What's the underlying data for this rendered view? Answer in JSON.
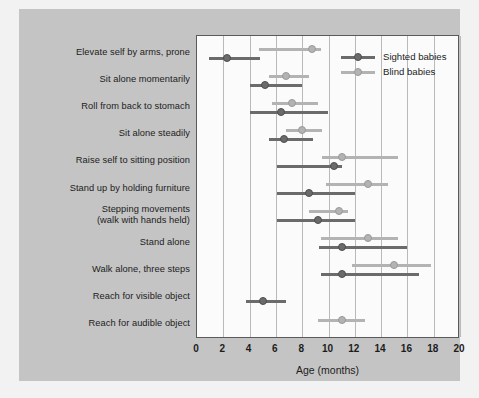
{
  "chart_data": {
    "type": "scatter",
    "title": "",
    "xlabel": "Age (months)",
    "ylabel": "",
    "xlim": [
      0,
      20
    ],
    "xticks": [
      "0",
      "2",
      "4",
      "6",
      "8",
      "10",
      "12",
      "14",
      "16",
      "18",
      "20"
    ],
    "grid": "vertical",
    "legend_position": "top-right",
    "legend": [
      {
        "name": "Sighted babies",
        "color": "#6b6b6b"
      },
      {
        "name": "Blind babies",
        "color": "#b3b3b3"
      }
    ],
    "categories": [
      "Elevate self by arms, prone",
      "Sit alone momentarily",
      "Roll from back to stomach",
      "Sit alone steadily",
      "Raise self to sitting position",
      "Stand up by holding furniture",
      "Stepping movements\n(walk with hands held)",
      "Stand alone",
      "Walk alone, three steps",
      "Reach for visible object",
      "Reach for audible object"
    ],
    "series": [
      {
        "name": "Sighted babies",
        "color": "#6b6b6b",
        "points": [
          {
            "category": "Elevate self by arms, prone",
            "median": 2.3,
            "low": 0.9,
            "high": 4.8
          },
          {
            "category": "Sit alone momentarily",
            "median": 5.2,
            "low": 4.0,
            "high": 8.0
          },
          {
            "category": "Roll from back to stomach",
            "median": 6.4,
            "low": 4.0,
            "high": 10.0
          },
          {
            "category": "Sit alone steadily",
            "median": 6.6,
            "low": 5.5,
            "high": 8.8
          },
          {
            "category": "Raise self to sitting position",
            "median": 10.4,
            "low": 6.1,
            "high": 11.0
          },
          {
            "category": "Stand up by holding furniture",
            "median": 8.5,
            "low": 6.1,
            "high": 12.0
          },
          {
            "category": "Stepping movements\n(walk with hands held)",
            "median": 9.2,
            "low": 6.1,
            "high": 12.0
          },
          {
            "category": "Stand alone",
            "median": 11.0,
            "low": 9.3,
            "high": 16.0
          },
          {
            "category": "Walk alone, three steps",
            "median": 11.0,
            "low": 9.4,
            "high": 16.9
          },
          {
            "category": "Reach for visible object",
            "median": 5.0,
            "low": 3.7,
            "high": 6.8
          },
          {
            "category": "Reach for audible object",
            "median": null,
            "low": null,
            "high": null
          }
        ]
      },
      {
        "name": "Blind babies",
        "color": "#b3b3b3",
        "points": [
          {
            "category": "Elevate self by arms, prone",
            "median": 8.75,
            "low": 4.7,
            "high": 9.4
          },
          {
            "category": "Sit alone momentarily",
            "median": 6.8,
            "low": 5.5,
            "high": 8.5
          },
          {
            "category": "Roll from back to stomach",
            "median": 7.25,
            "low": 5.7,
            "high": 9.2
          },
          {
            "category": "Sit alone steadily",
            "median": 8.0,
            "low": 6.8,
            "high": 9.5
          },
          {
            "category": "Raise self to sitting position",
            "median": 11.0,
            "low": 9.5,
            "high": 15.3
          },
          {
            "category": "Stand up by holding furniture",
            "median": 13.0,
            "low": 9.8,
            "high": 14.5
          },
          {
            "category": "Stepping movements\n(walk with hands held)",
            "median": 10.8,
            "low": 8.5,
            "high": 11.5
          },
          {
            "category": "Stand alone",
            "median": 13.0,
            "low": 9.4,
            "high": 15.3
          },
          {
            "category": "Walk alone, three steps",
            "median": 15.0,
            "low": 11.8,
            "high": 17.8
          },
          {
            "category": "Reach for visible object",
            "median": null,
            "low": null,
            "high": null
          },
          {
            "category": "Reach for audible object",
            "median": 11.0,
            "low": 9.2,
            "high": 12.8
          }
        ]
      }
    ]
  }
}
